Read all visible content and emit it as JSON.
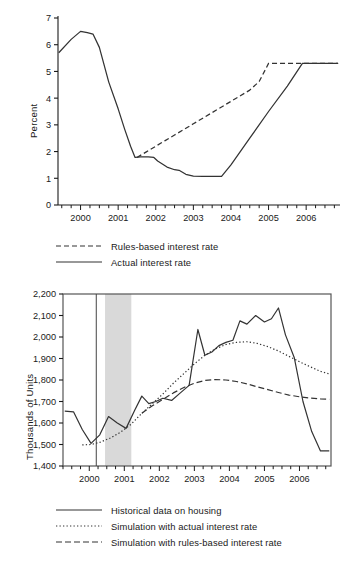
{
  "figure": {
    "panels": [
      {
        "id": "interest-rate-panel",
        "ylabel": "Percent"
      },
      {
        "id": "housing-panel",
        "ylabel": "Thousands of Units"
      }
    ]
  },
  "chart_data": [
    {
      "type": "line",
      "id": "interest-rate-chart",
      "title": "",
      "xlabel": "",
      "ylabel": "Percent",
      "xlim": [
        1999.4,
        2006.9
      ],
      "ylim": [
        0,
        7
      ],
      "yticks": [
        0,
        1,
        2,
        3,
        4,
        5,
        6,
        7
      ],
      "ytick_labels": [
        "0",
        "1",
        "2",
        "3",
        "4",
        "5",
        "6",
        "7"
      ],
      "xticks": [
        2000,
        2001,
        2002,
        2003,
        2004,
        2005,
        2006
      ],
      "xtick_labels": [
        "2000",
        "2001",
        "2002",
        "2003",
        "2004",
        "2005",
        "2006"
      ],
      "minor_xtick_interval": 0.25,
      "grid": false,
      "legend_position": "below",
      "series": [
        {
          "name": "Rules-based interest rate",
          "style": "dashed",
          "color": "#333333",
          "x": [
            2001.5,
            2001.75,
            2002.0,
            2002.25,
            2002.5,
            2002.75,
            2003.0,
            2003.25,
            2003.5,
            2003.75,
            2004.0,
            2004.25,
            2004.5,
            2004.75,
            2005.0,
            2005.5,
            2006.0,
            2006.5,
            2006.85
          ],
          "values": [
            1.78,
            1.99,
            2.2,
            2.41,
            2.62,
            2.83,
            3.04,
            3.25,
            3.46,
            3.67,
            3.88,
            4.09,
            4.3,
            4.62,
            5.3,
            5.3,
            5.3,
            5.3,
            5.3
          ]
        },
        {
          "name": "Actual interest rate",
          "style": "solid",
          "color": "#333333",
          "x": [
            1999.42,
            1999.75,
            2000.0,
            2000.18,
            2000.33,
            2000.5,
            2000.75,
            2001.0,
            2001.17,
            2001.33,
            2001.45,
            2001.6,
            2001.8,
            2001.95,
            2002.05,
            2002.3,
            2002.5,
            2002.62,
            2002.8,
            2003.0,
            2003.25,
            2003.5,
            2003.75,
            2004.0,
            2004.5,
            2005.0,
            2005.5,
            2005.9,
            2006.2,
            2006.6,
            2006.85
          ],
          "values": [
            5.7,
            6.2,
            6.5,
            6.45,
            6.4,
            5.9,
            4.6,
            3.6,
            2.85,
            2.2,
            1.78,
            1.8,
            1.8,
            1.78,
            1.65,
            1.42,
            1.32,
            1.3,
            1.15,
            1.08,
            1.07,
            1.07,
            1.07,
            1.5,
            2.5,
            3.5,
            4.45,
            5.3,
            5.3,
            5.3,
            5.3
          ]
        }
      ],
      "legend": [
        {
          "label": "Rules-based interest rate",
          "style": "dashed"
        },
        {
          "label": "Actual interest rate",
          "style": "solid"
        }
      ]
    },
    {
      "type": "line",
      "id": "housing-starts-chart",
      "title": "",
      "xlabel": "",
      "ylabel": "Thousands of Units",
      "xlim": [
        1999.25,
        2006.9
      ],
      "ylim": [
        1400,
        2200
      ],
      "yticks": [
        1400,
        1500,
        1600,
        1700,
        1800,
        1900,
        2000,
        2100,
        2200
      ],
      "ytick_labels": [
        "1,400",
        "1,500",
        "1,600",
        "1,700",
        "1,800",
        "1,900",
        "2,000",
        "2,100",
        "2,200"
      ],
      "xticks": [
        2000,
        2001,
        2002,
        2003,
        2004,
        2005,
        2006
      ],
      "xtick_labels": [
        "2000",
        "2001",
        "2002",
        "2003",
        "2004",
        "2005",
        "2006"
      ],
      "minor_xtick_interval": 0.25,
      "grid": false,
      "legend_position": "below",
      "vertical_marker_line": 2000.2,
      "shaded_band": {
        "start": 2000.45,
        "end": 2001.2,
        "color": "#d9d9d9"
      },
      "series": [
        {
          "name": "Historical data on housing",
          "style": "solid",
          "color": "#333333",
          "x": [
            1999.3,
            1999.55,
            1999.8,
            2000.05,
            2000.3,
            2000.55,
            2000.8,
            2001.05,
            2001.3,
            2001.5,
            2001.7,
            2001.9,
            2002.1,
            2002.35,
            2002.6,
            2002.85,
            2003.1,
            2003.3,
            2003.5,
            2003.7,
            2003.9,
            2004.1,
            2004.3,
            2004.5,
            2004.75,
            2005.0,
            2005.2,
            2005.4,
            2005.6,
            2005.85,
            2006.1,
            2006.35,
            2006.6,
            2006.85
          ],
          "values": [
            1655,
            1652,
            1570,
            1505,
            1545,
            1630,
            1600,
            1575,
            1660,
            1725,
            1690,
            1700,
            1715,
            1705,
            1740,
            1775,
            2035,
            1915,
            1930,
            1960,
            1975,
            1985,
            2075,
            2060,
            2100,
            2070,
            2085,
            2135,
            2010,
            1905,
            1700,
            1560,
            1470,
            1470
          ]
        },
        {
          "name": "Simulation with actual interest rate",
          "style": "dotted",
          "color": "#333333",
          "x": [
            1999.8,
            2000.05,
            2000.3,
            2000.6,
            2000.9,
            2001.2,
            2001.5,
            2001.8,
            2002.1,
            2002.4,
            2002.7,
            2003.0,
            2003.3,
            2003.6,
            2003.9,
            2004.2,
            2004.5,
            2004.8,
            2005.1,
            2005.4,
            2005.7,
            2006.0,
            2006.3,
            2006.6,
            2006.85
          ],
          "values": [
            1498,
            1500,
            1510,
            1530,
            1558,
            1595,
            1645,
            1690,
            1735,
            1785,
            1830,
            1875,
            1915,
            1945,
            1965,
            1975,
            1978,
            1970,
            1955,
            1935,
            1910,
            1885,
            1862,
            1840,
            1828
          ]
        },
        {
          "name": "Simulation with rules-based interest rate",
          "style": "dashdot",
          "color": "#333333",
          "x": [
            2001.5,
            2001.8,
            2002.1,
            2002.4,
            2002.7,
            2003.0,
            2003.3,
            2003.6,
            2003.9,
            2004.2,
            2004.5,
            2004.8,
            2005.1,
            2005.4,
            2005.7,
            2006.0,
            2006.3,
            2006.6,
            2006.85
          ],
          "values": [
            1645,
            1680,
            1710,
            1740,
            1765,
            1785,
            1798,
            1802,
            1800,
            1793,
            1782,
            1768,
            1755,
            1742,
            1730,
            1722,
            1716,
            1712,
            1710
          ]
        }
      ],
      "legend": [
        {
          "label": "Historical data on housing",
          "style": "solid"
        },
        {
          "label": "Simulation with actual interest rate",
          "style": "dotted"
        },
        {
          "label": "Simulation with rules-based interest rate",
          "style": "dashdot"
        }
      ]
    }
  ]
}
